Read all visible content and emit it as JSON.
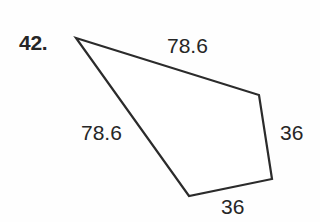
{
  "problem": {
    "number_label": "42."
  },
  "figure": {
    "kind": "quadrilateral",
    "stroke_color": "#2b2b2b",
    "fill_color": "#ffffff",
    "background_color": "#fefefe",
    "text_color": "#262626",
    "vertices": [
      {
        "name": "apex-top-left",
        "x": 76,
        "y": 38
      },
      {
        "name": "vertex-right-top",
        "x": 259,
        "y": 95
      },
      {
        "name": "vertex-right-bottom",
        "x": 272,
        "y": 179
      },
      {
        "name": "vertex-bottom-left",
        "x": 189,
        "y": 196
      }
    ],
    "side_labels": {
      "top": "78.6",
      "left": "78.6",
      "right": "36",
      "bottom": "36"
    }
  },
  "chart_data": {
    "type": "diagram",
    "title": "42.",
    "shape": "quadrilateral",
    "vertices": [
      [
        76,
        38
      ],
      [
        259,
        95
      ],
      [
        272,
        179
      ],
      [
        189,
        196
      ]
    ],
    "edges": [
      {
        "from": "apex-top-left",
        "to": "vertex-right-top",
        "label": "78.6",
        "position": "top"
      },
      {
        "from": "vertex-right-top",
        "to": "vertex-right-bottom",
        "label": "36",
        "position": "right"
      },
      {
        "from": "vertex-right-bottom",
        "to": "vertex-bottom-left",
        "label": "36",
        "position": "bottom"
      },
      {
        "from": "vertex-bottom-left",
        "to": "apex-top-left",
        "label": "78.6",
        "position": "left"
      }
    ],
    "labels": [
      "78.6",
      "36",
      "36",
      "78.6"
    ],
    "xlabel": "",
    "ylabel": "",
    "grid": false,
    "legend": false
  }
}
